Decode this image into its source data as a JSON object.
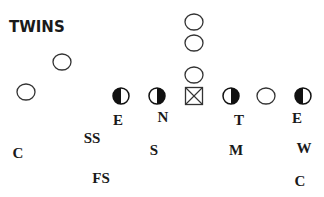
{
  "title": "TWINS",
  "offense": [
    {
      "id": "wr-left-far",
      "x": 26,
      "y": 92,
      "shape": "open-circle"
    },
    {
      "id": "wr-left-slot",
      "x": 62,
      "y": 62,
      "shape": "open-circle"
    },
    {
      "id": "qb-back-1",
      "x": 194,
      "y": 22,
      "shape": "open-circle"
    },
    {
      "id": "qb-back-2",
      "x": 194,
      "y": 43,
      "shape": "open-circle"
    },
    {
      "id": "qb",
      "x": 194,
      "y": 75,
      "shape": "open-circle"
    },
    {
      "id": "center",
      "x": 194,
      "y": 96,
      "shape": "square-x"
    },
    {
      "id": "right-guard",
      "x": 266,
      "y": 96,
      "shape": "open-circle"
    }
  ],
  "defensive_linemen": [
    {
      "id": "dl-e-left",
      "x": 121,
      "y": 96,
      "shape": "half-filled",
      "fill_side": "left"
    },
    {
      "id": "dl-n",
      "x": 157,
      "y": 96,
      "shape": "half-filled",
      "fill_side": "right"
    },
    {
      "id": "dl-t",
      "x": 231,
      "y": 96,
      "shape": "half-filled",
      "fill_side": "right"
    },
    {
      "id": "dl-e-right",
      "x": 303,
      "y": 96,
      "shape": "half-filled",
      "fill_side": "left"
    }
  ],
  "labels": [
    {
      "text": "E",
      "x": 118,
      "y": 120
    },
    {
      "text": "N",
      "x": 163,
      "y": 117
    },
    {
      "text": "T",
      "x": 239,
      "y": 120
    },
    {
      "text": "E",
      "x": 297,
      "y": 118
    },
    {
      "text": "SS",
      "x": 92,
      "y": 138
    },
    {
      "text": "C",
      "x": 18,
      "y": 153
    },
    {
      "text": "S",
      "x": 154,
      "y": 150
    },
    {
      "text": "M",
      "x": 236,
      "y": 150
    },
    {
      "text": "W",
      "x": 304,
      "y": 148
    },
    {
      "text": "FS",
      "x": 101,
      "y": 178
    },
    {
      "text": "C",
      "x": 300,
      "y": 181
    }
  ],
  "colors": {
    "stroke": "#333333",
    "fill": "#111111",
    "text": "#1a1a1a"
  }
}
